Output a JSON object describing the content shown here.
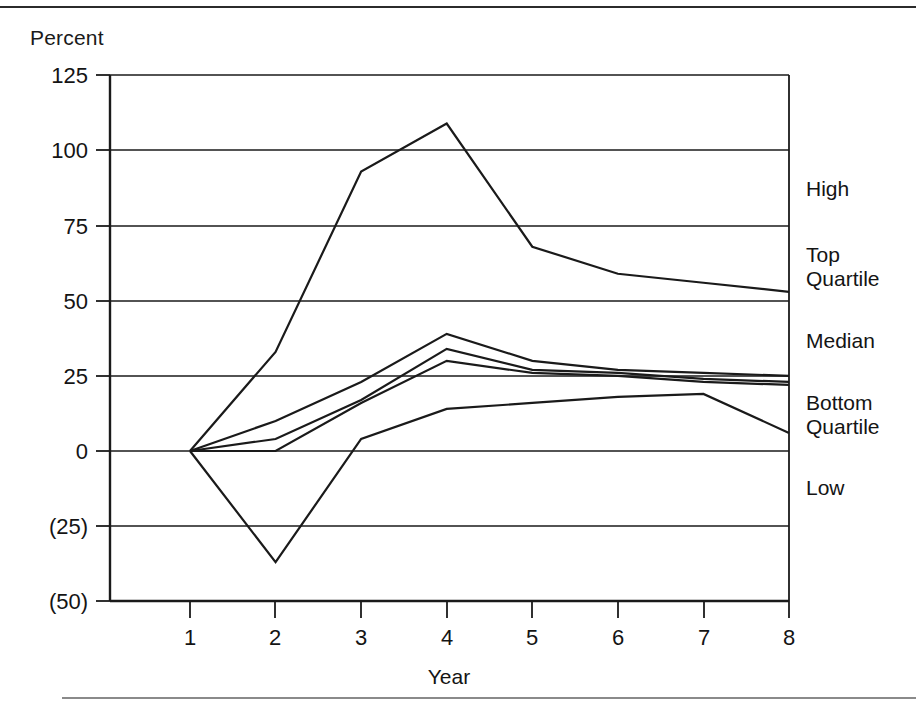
{
  "page": {
    "y_axis_title": "Percent",
    "x_axis_title": "Year"
  },
  "chart_data": {
    "type": "line",
    "title": "",
    "subtitle": "",
    "xlabel": "Year",
    "ylabel": "Percent",
    "x": [
      1,
      2,
      3,
      4,
      5,
      6,
      7,
      8
    ],
    "xtick_labels": [
      "1",
      "2",
      "3",
      "4",
      "5",
      "6",
      "7",
      "8"
    ],
    "ytick_values": [
      125,
      100,
      75,
      50,
      25,
      0,
      -25,
      -50
    ],
    "ytick_labels": [
      "125",
      "100",
      "75",
      "50",
      "25",
      "0",
      "(25)",
      "(50)"
    ],
    "ylim": [
      -50,
      125
    ],
    "xlim": [
      0.55,
      8.0
    ],
    "grid": true,
    "grid_axis": "y",
    "legend_position": "right-inline",
    "line_color": "#1a1a1a",
    "series": [
      {
        "name": "High",
        "label": "High",
        "values": [
          0,
          33,
          93,
          109,
          68,
          59,
          56,
          53
        ]
      },
      {
        "name": "Top Quartile",
        "label": "Top Quartile",
        "values": [
          0,
          10,
          23,
          39,
          30,
          27,
          26,
          25
        ]
      },
      {
        "name": "Median",
        "label": "Median",
        "values": [
          0,
          4,
          17,
          34,
          27,
          26,
          24,
          23
        ]
      },
      {
        "name": "Bottom Quartile",
        "label": "Bottom Quartile",
        "values": [
          0,
          0,
          16,
          30,
          26,
          25,
          23,
          22
        ]
      },
      {
        "name": "Low",
        "label": "Low",
        "values": [
          0,
          -37,
          4,
          14,
          16,
          18,
          19,
          6
        ]
      }
    ],
    "series_labels_right": [
      {
        "label": "High",
        "y_px": 196
      },
      {
        "label": "Top Quartile",
        "line1": "Top",
        "line2": "Quartile",
        "y_px": 262
      },
      {
        "label": "Median",
        "y_px": 344
      },
      {
        "label": "Bottom Quartile",
        "line1": "Bottom",
        "line2": "Quartile",
        "y_px": 404
      },
      {
        "label": "Low",
        "y_px": 489
      }
    ]
  }
}
